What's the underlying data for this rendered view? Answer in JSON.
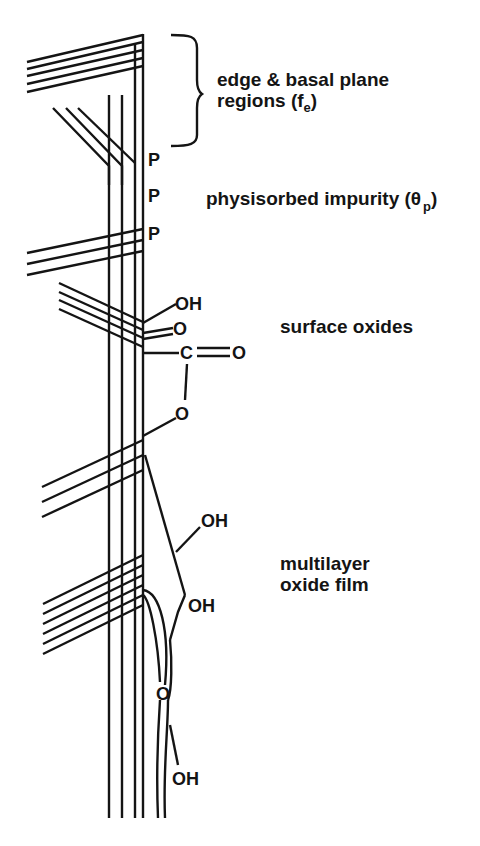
{
  "diagram": {
    "type": "carbon surface schematic",
    "regions": [
      {
        "id": "edge",
        "label_line1": "edge & basal plane",
        "label_line2_prefix": "regions (f",
        "label_line2_sub": "e",
        "label_line2_suffix": ")"
      },
      {
        "id": "physisorbed",
        "label_prefix": "physisorbed impurity (θ",
        "label_sub": "p",
        "label_suffix": ")"
      },
      {
        "id": "surface-oxides",
        "label": "surface oxides"
      },
      {
        "id": "multilayer",
        "label_line1": "multilayer",
        "label_line2": "oxide film"
      }
    ],
    "atoms": {
      "p1": "P",
      "p2": "P",
      "p3": "P",
      "oh1": "OH",
      "o1": "O",
      "c": "C",
      "o2": "O",
      "o3": "O",
      "oh2": "OH",
      "oh3": "OH",
      "o4": "O",
      "oh4": "OH"
    },
    "colors": {
      "ink": "#141414",
      "background": "#ffffff"
    }
  }
}
